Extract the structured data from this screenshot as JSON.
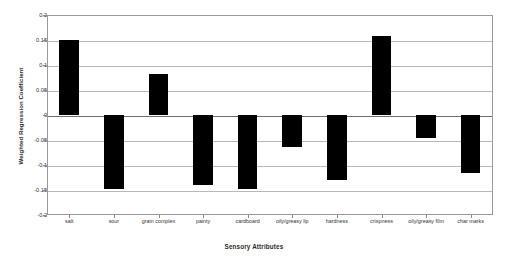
{
  "chart_data": {
    "type": "bar",
    "title": "",
    "xlabel": "Sensory Attributes",
    "ylabel": "Weighted Regression Coefficient",
    "categories": [
      "salt",
      "sour",
      "grain complex",
      "painty",
      "cardboard",
      "oily/greasy lip",
      "hardness",
      "crispness",
      "oily/greasy film",
      "char marks"
    ],
    "values": [
      0.15,
      -0.148,
      0.083,
      -0.14,
      -0.148,
      -0.063,
      -0.13,
      0.158,
      -0.045,
      -0.115
    ],
    "ylim": [
      -0.2,
      0.2
    ],
    "yticks": [
      0.2,
      0.15,
      0.1,
      0.05,
      0,
      -0.05,
      -0.1,
      -0.15,
      -0.2
    ],
    "ytick_labels": [
      "0.2",
      "0.15",
      "0.1",
      "0.05",
      "0",
      "-0.05",
      "-0.1",
      "-0.15",
      "-0.2"
    ],
    "grid": true,
    "legend": "none",
    "bar_color": "#000000",
    "background_color": "#ffffff",
    "gridline_color": "#b8b8b8",
    "axis_color": "#9a9a9a"
  }
}
